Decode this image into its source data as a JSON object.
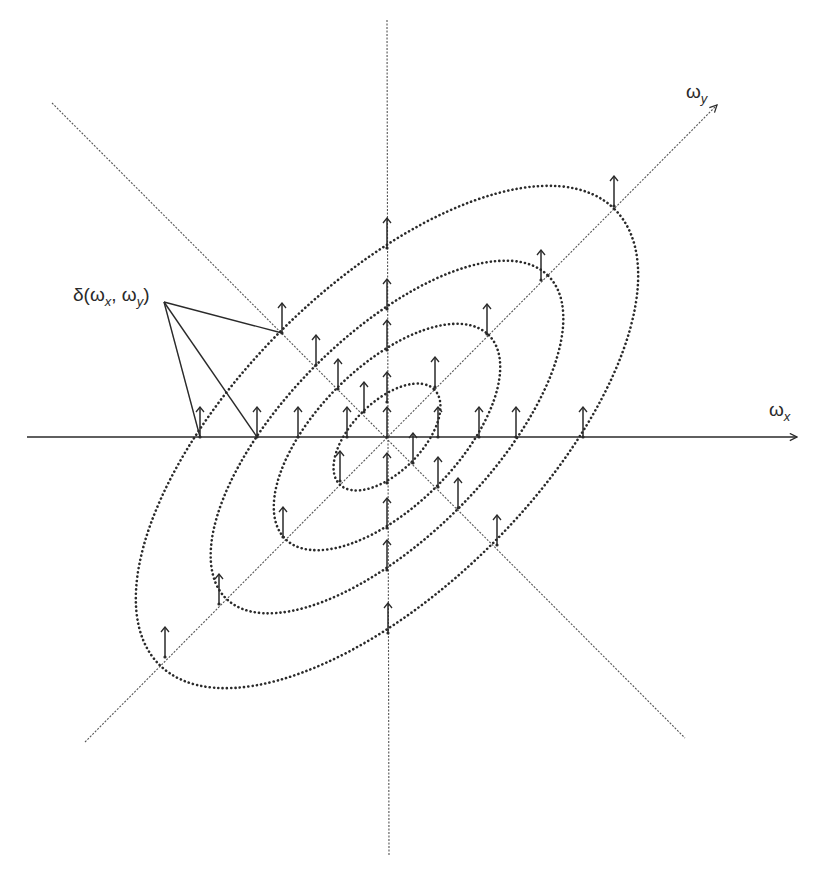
{
  "figure": {
    "width": 830,
    "height": 882,
    "center": [
      387,
      437
    ],
    "colors": {
      "ink": "#2a2a2a",
      "axis_fine": "#555555",
      "background": "#ffffff"
    }
  },
  "axes": {
    "x_axis": {
      "from": [
        27,
        437
      ],
      "to": [
        797,
        437
      ],
      "style": "solid",
      "label_base": "ω",
      "label_sub": "x",
      "label_pos": [
        769,
        400
      ]
    },
    "y_diag_axis": {
      "from": [
        85,
        742
      ],
      "to": [
        717,
        105
      ],
      "style": "dashed",
      "label_base": "ω",
      "label_sub": "y",
      "label_pos": [
        686,
        82
      ]
    },
    "vertical_axis": {
      "from": [
        387,
        20
      ],
      "to": [
        389,
        855
      ],
      "style": "dashed"
    },
    "anti_diagonal": {
      "from": [
        52,
        103
      ],
      "to": [
        685,
        738
      ],
      "style": "dashed"
    }
  },
  "ellipses": [
    {
      "name": "ring-1",
      "rx": 322,
      "ry": 150,
      "rotation": -45
    },
    {
      "name": "ring-2",
      "rx": 228,
      "ry": 101,
      "rotation": -45
    },
    {
      "name": "ring-3",
      "rx": 144,
      "ry": 70,
      "rotation": -45
    },
    {
      "name": "ring-4",
      "rx": 67,
      "ry": 35,
      "rotation": -45
    }
  ],
  "impulses": {
    "length": 30,
    "points": [
      [
        614,
        206
      ],
      [
        541,
        280
      ],
      [
        487,
        334
      ],
      [
        435,
        387
      ],
      [
        340,
        481
      ],
      [
        283,
        537
      ],
      [
        219,
        604
      ],
      [
        165,
        657
      ],
      [
        282,
        333
      ],
      [
        316,
        365
      ],
      [
        338,
        389
      ],
      [
        364,
        412
      ],
      [
        413,
        463
      ],
      [
        438,
        487
      ],
      [
        458,
        508
      ],
      [
        497,
        545
      ],
      [
        387,
        248
      ],
      [
        387,
        309
      ],
      [
        387,
        350
      ],
      [
        387,
        402
      ],
      [
        387,
        437
      ],
      [
        387,
        483
      ],
      [
        387,
        528
      ],
      [
        387,
        570
      ],
      [
        388,
        633
      ],
      [
        200,
        437
      ],
      [
        257,
        437
      ],
      [
        298,
        437
      ],
      [
        347,
        437
      ],
      [
        438,
        437
      ],
      [
        479,
        437
      ],
      [
        516,
        437
      ],
      [
        583,
        437
      ]
    ]
  },
  "annotation": {
    "text_prefix": "δ(",
    "arg1_base": "ω",
    "arg1_sub": "x",
    "separator": ", ",
    "arg2_base": "ω",
    "arg2_sub": "y",
    "text_suffix": ")",
    "label_pos": [
      73,
      285
    ],
    "pointer_origin": [
      164,
      302
    ],
    "pointer_targets": [
      [
        282,
        333
      ],
      [
        200,
        437
      ],
      [
        257,
        437
      ]
    ]
  }
}
